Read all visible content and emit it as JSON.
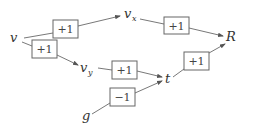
{
  "diagram": {
    "nodes": {
      "v": {
        "label": "v",
        "x": 10,
        "y": 42
      },
      "vx": {
        "label": "v",
        "sub": "x",
        "x": 124,
        "y": 18
      },
      "R": {
        "label": "R",
        "x": 226,
        "y": 41
      },
      "vy": {
        "label": "v",
        "sub": "y",
        "x": 80,
        "y": 72
      },
      "t": {
        "label": "t",
        "x": 165,
        "y": 83
      },
      "g": {
        "label": "g",
        "x": 82,
        "y": 120
      }
    },
    "weights": {
      "v_to_vx": "+1",
      "v_to_vy": "+1",
      "vx_to_R": "+1",
      "vy_to_t": "+1",
      "g_to_t": "−1",
      "t_to_R": "+1"
    },
    "colors": {
      "stroke": "#555555",
      "box_border": "#666666",
      "text": "#333333"
    }
  }
}
